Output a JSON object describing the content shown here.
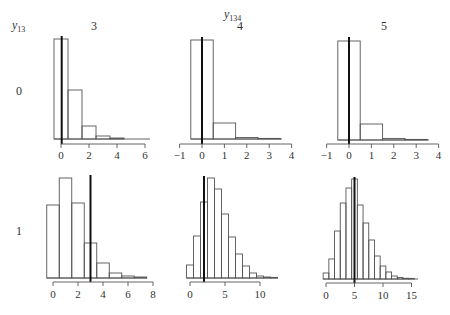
{
  "chart_data": {
    "type": "histogram-grid",
    "title": "",
    "col_header": {
      "label": "y",
      "subscript": "134"
    },
    "row_header": {
      "label": "y",
      "subscript": "13"
    },
    "columns": [
      "3",
      "4",
      "5"
    ],
    "rows": [
      "0",
      "1"
    ],
    "panels": [
      {
        "row": "0",
        "col": "3",
        "xticks": [
          0,
          2,
          4,
          6
        ],
        "bin_start": -0.5,
        "bin_width": 1,
        "relative_heights": [
          100,
          49,
          13,
          3,
          1
        ],
        "vline": 0.05
      },
      {
        "row": "0",
        "col": "4",
        "xticks": [
          -1,
          0,
          1,
          2,
          3,
          4
        ],
        "bin_start": -0.5,
        "bin_width": 1,
        "relative_heights": [
          99,
          16,
          1.5,
          0.5
        ],
        "vline": 0.0
      },
      {
        "row": "0",
        "col": "5",
        "xticks": [
          -1,
          0,
          1,
          2,
          3,
          4
        ],
        "bin_start": -0.5,
        "bin_width": 1,
        "relative_heights": [
          99,
          16,
          1.5,
          0.5
        ],
        "vline": 0.0
      },
      {
        "row": "1",
        "col": "3",
        "xticks": [
          0,
          2,
          4,
          6,
          8
        ],
        "bin_start": -0.5,
        "bin_width": 1,
        "relative_heights": [
          73,
          100,
          75,
          35,
          15,
          5,
          2,
          1
        ],
        "vline": 3.0
      },
      {
        "row": "1",
        "col": "4",
        "xticks": [
          0,
          5,
          10
        ],
        "bin_start": -0.5,
        "bin_width": 1,
        "relative_heights": [
          13,
          42,
          76,
          100,
          89,
          64,
          41,
          24,
          12,
          5,
          2,
          1,
          0.5
        ],
        "vline": 2.0
      },
      {
        "row": "1",
        "col": "5",
        "xticks": [
          0,
          5,
          10,
          15
        ],
        "bin_start": -0.5,
        "bin_width": 1,
        "relative_heights": [
          6,
          20,
          48,
          76,
          91,
          100,
          74,
          56,
          39,
          23,
          13,
          7,
          3,
          1.5,
          0.7,
          0.3
        ],
        "vline": 5.0
      }
    ],
    "legend": null,
    "grid": false
  },
  "layout": {
    "panels": [
      {
        "x0": 61,
        "ppu": 14.0,
        "base": 139,
        "axis_y": 144,
        "tick_lbl_y": 159,
        "hmax": 100,
        "axis_from": 0,
        "axis_to": 6,
        "bars_to_x": 150,
        "vline_top": 36
      },
      {
        "x0": 202,
        "ppu": 22.4,
        "base": 139,
        "axis_y": 144,
        "tick_lbl_y": 159,
        "hmax": 100,
        "axis_from": -1,
        "axis_to": 4,
        "bars_to_x": 282,
        "vline_top": 37
      },
      {
        "x0": 349,
        "ppu": 22.4,
        "base": 140,
        "axis_y": 144,
        "tick_lbl_y": 159,
        "hmax": 100,
        "axis_from": -1,
        "axis_to": 4,
        "bars_to_x": 429,
        "vline_top": 37
      },
      {
        "x0": 53,
        "ppu": 12.5,
        "base": 278,
        "axis_y": 282,
        "tick_lbl_y": 298,
        "hmax": 100,
        "axis_from": 0,
        "axis_to": 8,
        "bars_to_x": 147,
        "vline_top": 175
      },
      {
        "x0": 190,
        "ppu": 7.0,
        "base": 278,
        "axis_y": 282,
        "tick_lbl_y": 298,
        "hmax": 100,
        "axis_from": 0,
        "axis_to": 10,
        "bars_to_x": 278,
        "vline_top": 176
      },
      {
        "x0": 326,
        "ppu": 5.7,
        "base": 279,
        "axis_y": 283,
        "tick_lbl_y": 299,
        "hmax": 100,
        "axis_from": 0,
        "axis_to": 15,
        "bars_to_x": 418,
        "vline_top": 177
      }
    ],
    "col_label_x": [
      94,
      240,
      384
    ],
    "col_label_y": 30,
    "row_label_x": 19,
    "row_label_y": [
      95,
      235
    ]
  },
  "colors": {
    "bar_stroke": "#555555",
    "vline": "#111111",
    "axis": "#555555",
    "text": "#333333"
  }
}
